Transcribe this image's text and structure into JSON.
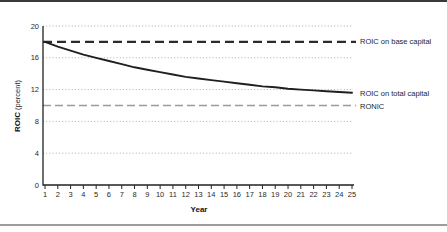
{
  "colors": {
    "background": "#ffffff",
    "axis": "#222222",
    "grid": "#aeaeae",
    "top_rule": "#3a3a3a",
    "bottom_rule": "#9c9c9c",
    "base_line": "#2b2b2b",
    "total_line": "#1f1f1f",
    "ronic_line": "#9b9b9b",
    "tick_text": "#2a2a2a"
  },
  "chart_data": {
    "type": "line",
    "title": "",
    "xlabel": "Year",
    "ylabel": "ROIC (percent)",
    "ylabel_bold": "ROIC",
    "ylabel_rest": "(percent)",
    "xlim": [
      1,
      25
    ],
    "ylim": [
      0,
      20
    ],
    "xticks": [
      1,
      2,
      3,
      4,
      5,
      6,
      7,
      8,
      9,
      10,
      11,
      12,
      13,
      14,
      15,
      16,
      17,
      18,
      19,
      20,
      21,
      22,
      23,
      24,
      25
    ],
    "yticks": [
      0,
      4,
      8,
      12,
      16,
      20
    ],
    "grid": "horizontal dotted lines at y ticks above 0",
    "legend_position": "labels at right end of each line, outside plot",
    "x": [
      1,
      2,
      3,
      4,
      5,
      6,
      7,
      8,
      9,
      10,
      11,
      12,
      13,
      14,
      15,
      16,
      17,
      18,
      19,
      20,
      21,
      22,
      23,
      24,
      25
    ],
    "series": [
      {
        "name": "ROIC on base capital",
        "type": "hline",
        "style": "dashed",
        "color": "#2b2b2b",
        "value": 18
      },
      {
        "name": "ROIC on total capital",
        "type": "line",
        "style": "solid",
        "color": "#1f1f1f",
        "values": [
          18.0,
          17.4,
          16.9,
          16.4,
          16.0,
          15.6,
          15.2,
          14.8,
          14.5,
          14.2,
          13.9,
          13.6,
          13.4,
          13.2,
          13.0,
          12.8,
          12.6,
          12.4,
          12.3,
          12.1,
          12.0,
          11.9,
          11.8,
          11.7,
          11.6
        ]
      },
      {
        "name": "RONIC",
        "type": "hline",
        "style": "dashed",
        "color": "#9b9b9b",
        "value": 10
      }
    ]
  }
}
